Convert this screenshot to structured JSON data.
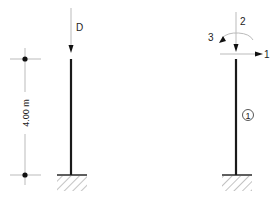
{
  "diagram": {
    "type": "structural-column-model",
    "left_model": {
      "load_label": "D",
      "dimension_label": "4.00 m",
      "support": "fixed"
    },
    "right_model": {
      "dof_labels": {
        "horizontal": "1",
        "vertical": "2",
        "rotation": "3"
      },
      "member_label": "1",
      "support": "fixed"
    },
    "colors": {
      "member": "#1a1a1a",
      "thin_line": "#bbbbbb",
      "arrow": "#111111",
      "hatch": "#888888"
    }
  }
}
